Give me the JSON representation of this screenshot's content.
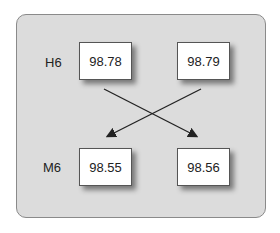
{
  "rows": [
    {
      "label": "H6",
      "values": [
        "98.78",
        "98.79"
      ]
    },
    {
      "label": "M6",
      "values": [
        "98.55",
        "98.56"
      ]
    }
  ],
  "arrows": [
    {
      "from": "H6.0",
      "to": "M6.1"
    },
    {
      "from": "H6.1",
      "to": "M6.0"
    }
  ],
  "colors": {
    "panel": "#dcdcdc",
    "box": "#ffffff",
    "line": "#222222"
  }
}
